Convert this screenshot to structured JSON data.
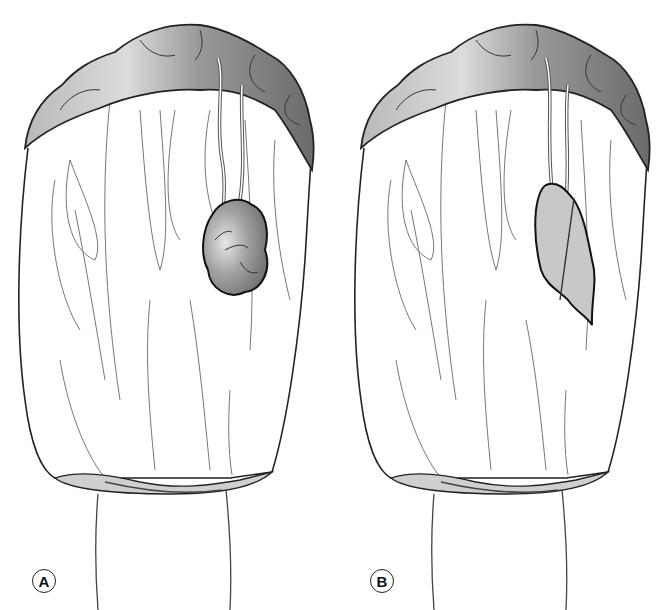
{
  "figure": {
    "panels": [
      {
        "id": "A",
        "label": "A",
        "lesion": "lobulated nodular mass with vessels on surface (dark shaded)"
      },
      {
        "id": "B",
        "label": "B",
        "lesion": "flat plaque-like lesion (light shaded) bisected by a line"
      }
    ],
    "colors": {
      "arch_light": "#d8d8d8",
      "arch_dark": "#707070",
      "lesion_a": "#8a8a8a",
      "lesion_b": "#c8c8c8",
      "outline": "#222222",
      "fold_lines": "#666666",
      "base_band": "#c0c0c0"
    }
  }
}
